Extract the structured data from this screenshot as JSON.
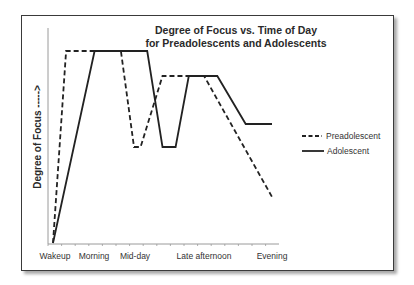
{
  "chart_data": {
    "type": "line",
    "title": "Degree of Focus vs. Time of Day",
    "subtitle": "for Preadolescents and Adolescents",
    "title_lines": [
      "Degree of Focus vs. Time of Day",
      "for Preadolescents and Adolescents"
    ],
    "xlabel": "",
    "ylabel": "Degree of Focus ----->",
    "x_tick_labels": [
      "Wakeup",
      "Morning",
      "Mid-day",
      "Late afternoon",
      "Evening"
    ],
    "y_tick_labels": [],
    "ylim": [
      0,
      100
    ],
    "grid": false,
    "legend_position": "right",
    "note": "Y values are relative degree of focus (0 = baseline at wakeup, 100 = peak); x positions in chart-relative units where Wakeup=0 and Evening=10.",
    "series": [
      {
        "name": "Preadolescent",
        "style": "dashed",
        "color": "#222222",
        "points": [
          {
            "x": 0.0,
            "y": 0
          },
          {
            "x": 0.6,
            "y": 100
          },
          {
            "x": 3.1,
            "y": 100
          },
          {
            "x": 3.7,
            "y": 50
          },
          {
            "x": 4.0,
            "y": 50
          },
          {
            "x": 5.0,
            "y": 87
          },
          {
            "x": 6.9,
            "y": 87
          },
          {
            "x": 10.0,
            "y": 24
          }
        ]
      },
      {
        "name": "Adolescent",
        "style": "solid",
        "color": "#222222",
        "points": [
          {
            "x": 0.0,
            "y": 0
          },
          {
            "x": 1.9,
            "y": 100
          },
          {
            "x": 4.3,
            "y": 100
          },
          {
            "x": 5.0,
            "y": 50
          },
          {
            "x": 5.6,
            "y": 50
          },
          {
            "x": 6.2,
            "y": 87
          },
          {
            "x": 7.5,
            "y": 87
          },
          {
            "x": 8.8,
            "y": 62
          },
          {
            "x": 10.0,
            "y": 62
          }
        ]
      }
    ]
  },
  "legend": {
    "items": [
      {
        "label": "Preadolescent",
        "style": "dashed"
      },
      {
        "label": "Adolescent",
        "style": "solid"
      }
    ]
  },
  "colors": {
    "line": "#222222",
    "axis": "#888888",
    "frame": "#3a3a3a",
    "text": "#2a2a2a"
  }
}
